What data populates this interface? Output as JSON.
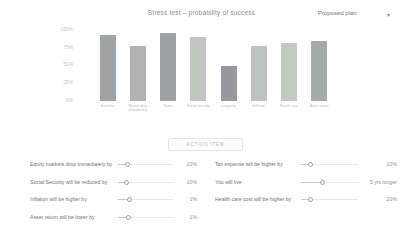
{
  "header": {
    "title": "Stress test – probability of success",
    "plan_selector": {
      "value": "Proposed plan",
      "caret": "▾"
    }
  },
  "chart_data": {
    "type": "bar",
    "title": "Stress test – probability of success",
    "categories": [
      "Baseline",
      "Market drop immediately",
      "Taxes",
      "Social security",
      "Longevity",
      "Inflation",
      "Health care",
      "Asset return"
    ],
    "values": [
      93,
      78,
      96,
      90,
      50,
      78,
      82,
      85
    ],
    "bar_colors": [
      "#a0a4a7",
      "#afb3b1",
      "#9ba1a5",
      "#c2c4c2",
      "#95989c",
      "#bfc2c0",
      "#c5c7c5",
      "#a7aaa9"
    ],
    "xlabel": "",
    "ylabel": "",
    "ylim": [
      0,
      100
    ],
    "yticks": [
      "100%",
      "75%",
      "50%",
      "25%",
      "0%"
    ],
    "grid": false,
    "legend": "none"
  },
  "action_button": {
    "label": "ACTION ITEM"
  },
  "stress_tests": {
    "left": [
      {
        "label": "Equity markets drop immediately by",
        "value": "20%",
        "knob_pct": 18
      },
      {
        "label": "Social Security will be reduced by",
        "value": "10%",
        "knob_pct": 15
      },
      {
        "label": "Inflation will be higher by",
        "value": "1%",
        "knob_pct": 21
      },
      {
        "label": "Asset return will be lower by",
        "value": "1%",
        "knob_pct": 19
      }
    ],
    "right": [
      {
        "label": "Tax expense will be higher by",
        "value": "20%",
        "knob_pct": 16
      },
      {
        "label": "You will live",
        "value": "5 yrs longer",
        "knob_pct": 37
      },
      {
        "label": "Health care cost will be higher by",
        "value": "20%",
        "knob_pct": 16
      }
    ]
  }
}
